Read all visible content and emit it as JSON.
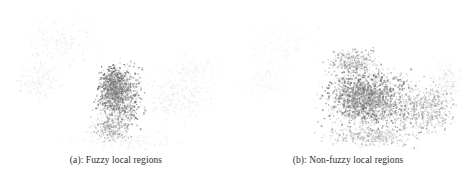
{
  "figure": {
    "background_color": "#ffffff",
    "width": 464,
    "height": 177,
    "panel_count": 2
  },
  "panels": [
    {
      "id": "a",
      "caption": "(a): Fuzzy local regions",
      "label": "(a)",
      "title": "Fuzzy local regions",
      "speckle_color_dark": "#6e6e6e",
      "speckle_color_mid": "#a8a8a8",
      "speckle_color_light": "#dcdcdc"
    },
    {
      "id": "b",
      "caption": "(b): Non-fuzzy local regions",
      "label": "(b)",
      "title": "Non-fuzzy local regions",
      "speckle_color_dark": "#6e6e6e",
      "speckle_color_mid": "#a8a8a8",
      "speckle_color_light": "#dcdcdc"
    }
  ],
  "chart_data": {
    "type": "scatter",
    "title": "",
    "xlabel": "",
    "ylabel": "",
    "grid": false,
    "legend": null,
    "panels": [
      {
        "name": "(a): Fuzzy local regions",
        "xlim": [
          0,
          232
        ],
        "ylim": [
          0,
          150
        ],
        "clusters": [
          {
            "name": "diffuse-upper-left-cloud",
            "cx": 62,
            "cy": 40,
            "rx": 52,
            "ry": 34,
            "count": 320,
            "opacity": 0.16,
            "size": 1.0
          },
          {
            "name": "diffuse-left-mid-cloud",
            "cx": 38,
            "cy": 78,
            "rx": 34,
            "ry": 28,
            "count": 230,
            "opacity": 0.18,
            "size": 1.0
          },
          {
            "name": "dense-central-blob",
            "cx": 118,
            "cy": 96,
            "rx": 30,
            "ry": 40,
            "count": 820,
            "opacity": 0.62,
            "size": 1.2
          },
          {
            "name": "dense-blob-core",
            "cx": 112,
            "cy": 85,
            "rx": 17,
            "ry": 24,
            "count": 420,
            "opacity": 0.72,
            "size": 1.3
          },
          {
            "name": "lower-blob-tail",
            "cx": 110,
            "cy": 128,
            "rx": 26,
            "ry": 16,
            "count": 300,
            "opacity": 0.5,
            "size": 1.1
          },
          {
            "name": "faint-right-band",
            "cx": 178,
            "cy": 96,
            "rx": 52,
            "ry": 34,
            "count": 420,
            "opacity": 0.17,
            "size": 1.0
          },
          {
            "name": "faint-right-upper",
            "cx": 192,
            "cy": 70,
            "rx": 40,
            "ry": 22,
            "count": 210,
            "opacity": 0.13,
            "size": 1.0
          },
          {
            "name": "faint-bottom-band",
            "cx": 120,
            "cy": 140,
            "rx": 76,
            "ry": 12,
            "count": 260,
            "opacity": 0.16,
            "size": 1.0
          }
        ]
      },
      {
        "name": "(b): Non-fuzzy local regions",
        "xlim": [
          0,
          232
        ],
        "ylim": [
          0,
          150
        ],
        "clusters": [
          {
            "name": "very-faint-upper-left",
            "cx": 48,
            "cy": 45,
            "rx": 48,
            "ry": 34,
            "count": 300,
            "opacity": 0.11,
            "size": 1.0
          },
          {
            "name": "faint-left-mid",
            "cx": 30,
            "cy": 82,
            "rx": 30,
            "ry": 26,
            "count": 170,
            "opacity": 0.12,
            "size": 1.0
          },
          {
            "name": "dense-main-mass",
            "cx": 142,
            "cy": 102,
            "rx": 66,
            "ry": 42,
            "count": 1250,
            "opacity": 0.55,
            "size": 1.2
          },
          {
            "name": "dense-mass-core",
            "cx": 130,
            "cy": 95,
            "rx": 42,
            "ry": 32,
            "count": 700,
            "opacity": 0.66,
            "size": 1.25
          },
          {
            "name": "dense-upper-arc",
            "cx": 120,
            "cy": 62,
            "rx": 34,
            "ry": 18,
            "count": 340,
            "opacity": 0.52,
            "size": 1.15
          },
          {
            "name": "dense-right-wing",
            "cx": 196,
            "cy": 108,
            "rx": 36,
            "ry": 34,
            "count": 480,
            "opacity": 0.48,
            "size": 1.1
          },
          {
            "name": "dense-lower-band",
            "cx": 140,
            "cy": 136,
            "rx": 62,
            "ry": 14,
            "count": 420,
            "opacity": 0.42,
            "size": 1.05
          },
          {
            "name": "faint-right-edge",
            "cx": 214,
            "cy": 80,
            "rx": 22,
            "ry": 28,
            "count": 180,
            "opacity": 0.22,
            "size": 1.0
          }
        ]
      }
    ]
  }
}
